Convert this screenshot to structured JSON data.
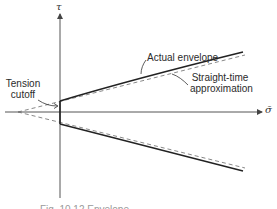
{
  "figure": {
    "y_axis_label": "τ",
    "x_axis_label": "σ̄",
    "annotations": {
      "actual_envelope": "Actual envelope",
      "straight_line_approx_line1": "Straight-time",
      "straight_line_approx_line2": "approximation",
      "tension_cutoff_line1": "Tension",
      "tension_cutoff_line2": "cutoff"
    },
    "caption": "Fig. 10.12  Envelope"
  },
  "colors": {
    "background": "#ffffff",
    "line": "#2a2a2a",
    "axis": "#555555",
    "dashed": "#6a6a6a",
    "caption": "#9a9a9a"
  }
}
